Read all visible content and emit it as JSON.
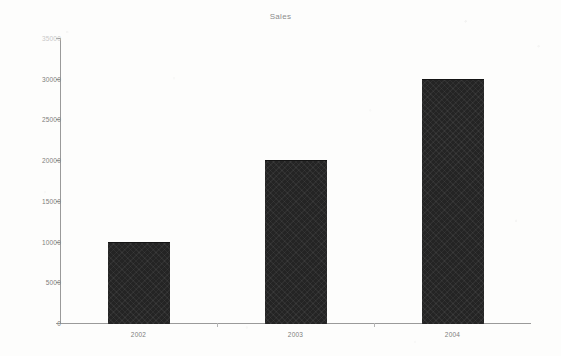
{
  "chart_data": {
    "type": "bar",
    "title": "Sales",
    "xlabel": "",
    "ylabel": "",
    "categories": [
      "2002",
      "2003",
      "2004"
    ],
    "values": [
      10000,
      20000,
      30000
    ],
    "series": [
      {
        "name": "Sales",
        "values": [
          10000,
          20000,
          30000
        ]
      }
    ],
    "ylim": [
      0,
      35000
    ],
    "ytick_labels": [
      "0",
      "5000",
      "10000",
      "15000",
      "20000",
      "25000",
      "30000",
      "35000"
    ],
    "ytick_values": [
      0,
      5000,
      10000,
      15000,
      20000,
      25000,
      30000,
      35000
    ],
    "ytick_interval": 5000,
    "grid": false,
    "legend": null,
    "legend_position": "none",
    "bar_color": "#242424",
    "axis_color": "#9a9a9a",
    "text_color": "#7d7d7d",
    "background_color": "#fdfdfc"
  }
}
